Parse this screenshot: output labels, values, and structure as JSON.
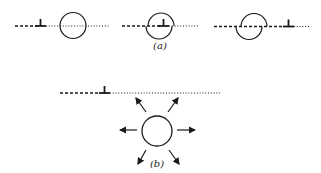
{
  "diagram": {
    "stroke_color": "#1a1a1a",
    "background": "#ffffff",
    "part_a": {
      "label": "(a)",
      "panels": [
        {
          "id": "a1",
          "description": "dislocation approaching cavity along slip plane"
        },
        {
          "id": "a2",
          "description": "dislocation absorbed at cavity"
        },
        {
          "id": "a3",
          "description": "dislocation passed through, cavity sheared by one Burgers vector"
        }
      ]
    },
    "part_b": {
      "label": "(b)",
      "description": "cavity emitting vacancies / strain radiating outward, dislocation on slip plane above",
      "arrow_count": 6
    }
  }
}
